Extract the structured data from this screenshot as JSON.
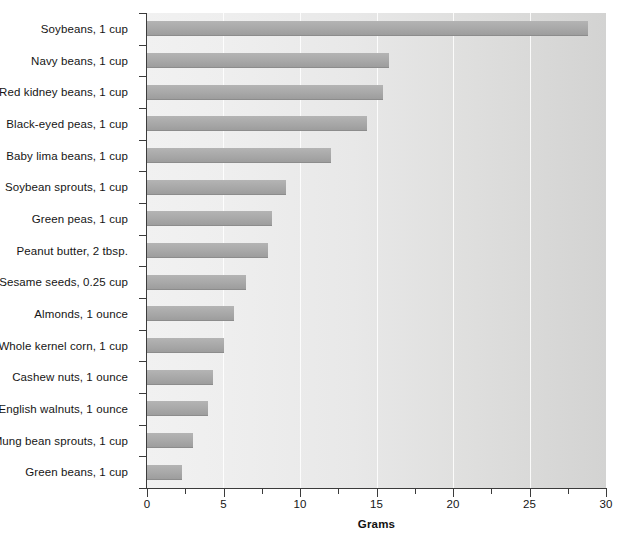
{
  "chart_data": {
    "type": "bar",
    "orientation": "horizontal",
    "title": "",
    "xlabel": "Grams",
    "ylabel": "",
    "xlim": [
      0,
      30
    ],
    "xticks": [
      0,
      5,
      10,
      15,
      20,
      25,
      30
    ],
    "xtick_labels": [
      "0",
      "5",
      "10",
      "15",
      "20",
      "25",
      "30"
    ],
    "minor_tick_step": 2.5,
    "grid": "vertical-major-only",
    "legend": "none",
    "bar_color": "#a8a8a8",
    "plot_background": "#e8e8e8",
    "categories": [
      "Soybeans, 1 cup",
      "Navy beans, 1 cup",
      "Red kidney beans, 1 cup",
      "Black-eyed peas, 1 cup",
      "Baby lima beans, 1 cup",
      "Soybean sprouts, 1 cup",
      "Green peas, 1 cup",
      "Peanut butter, 2 tbsp.",
      "Sesame seeds, 0.25 cup",
      "Almonds, 1 ounce",
      "Whole kernel corn, 1 cup",
      "Cashew nuts, 1 ounce",
      "English walnuts, 1 ounce",
      "Mung bean sprouts, 1 cup",
      "Green beans, 1 cup"
    ],
    "values": [
      28.8,
      15.8,
      15.4,
      14.4,
      12.0,
      9.1,
      8.2,
      7.9,
      6.5,
      5.7,
      5.0,
      4.3,
      4.0,
      3.0,
      2.3
    ]
  }
}
